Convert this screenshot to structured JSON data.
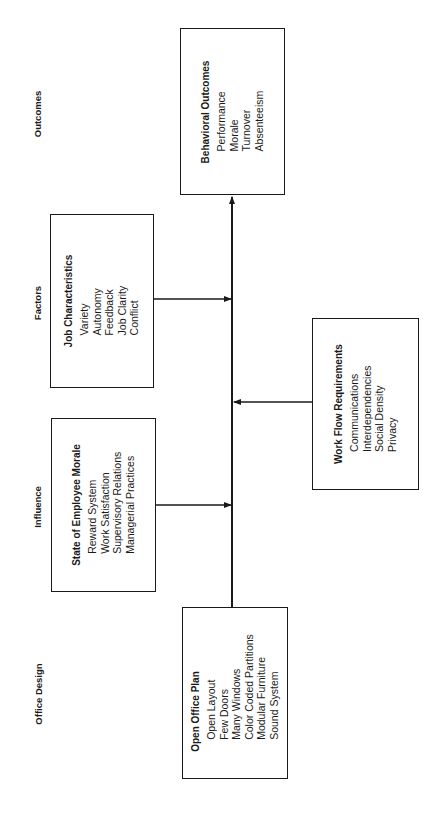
{
  "columns": {
    "outcomes": "Outcomes",
    "factors": "Factors",
    "influence": "Influence",
    "office_design": "Office Design"
  },
  "boxes": {
    "behavioral_outcomes": {
      "title": "Behavioral Outcomes",
      "items": [
        "Performance",
        "Morale",
        "Turnover",
        "Absenteeism"
      ]
    },
    "job_characteristics": {
      "title": "Job Characteristics",
      "items": [
        "Variety",
        "Autonomy",
        "Feedback",
        "Job Clarity",
        "Conflict"
      ]
    },
    "work_flow_requirements": {
      "title": "Work Flow Requirements",
      "items": [
        "Communications",
        "Interdependencies",
        "Social Density",
        "Privacy"
      ]
    },
    "state_of_employee_morale": {
      "title": "State of Employee Morale",
      "items": [
        "Reward System",
        "Work Satisfaction",
        "Supervisory Relations",
        "Managerial Practices"
      ]
    },
    "open_office_plan": {
      "title": "Open Office Plan",
      "items": [
        "Open Layout",
        "Few Doors",
        "Many Windows",
        "Color Coded Partitions",
        "Modular Furniture",
        "Sound System"
      ]
    }
  },
  "colors": {
    "line": "#1a1a1a",
    "background": "#ffffff"
  }
}
